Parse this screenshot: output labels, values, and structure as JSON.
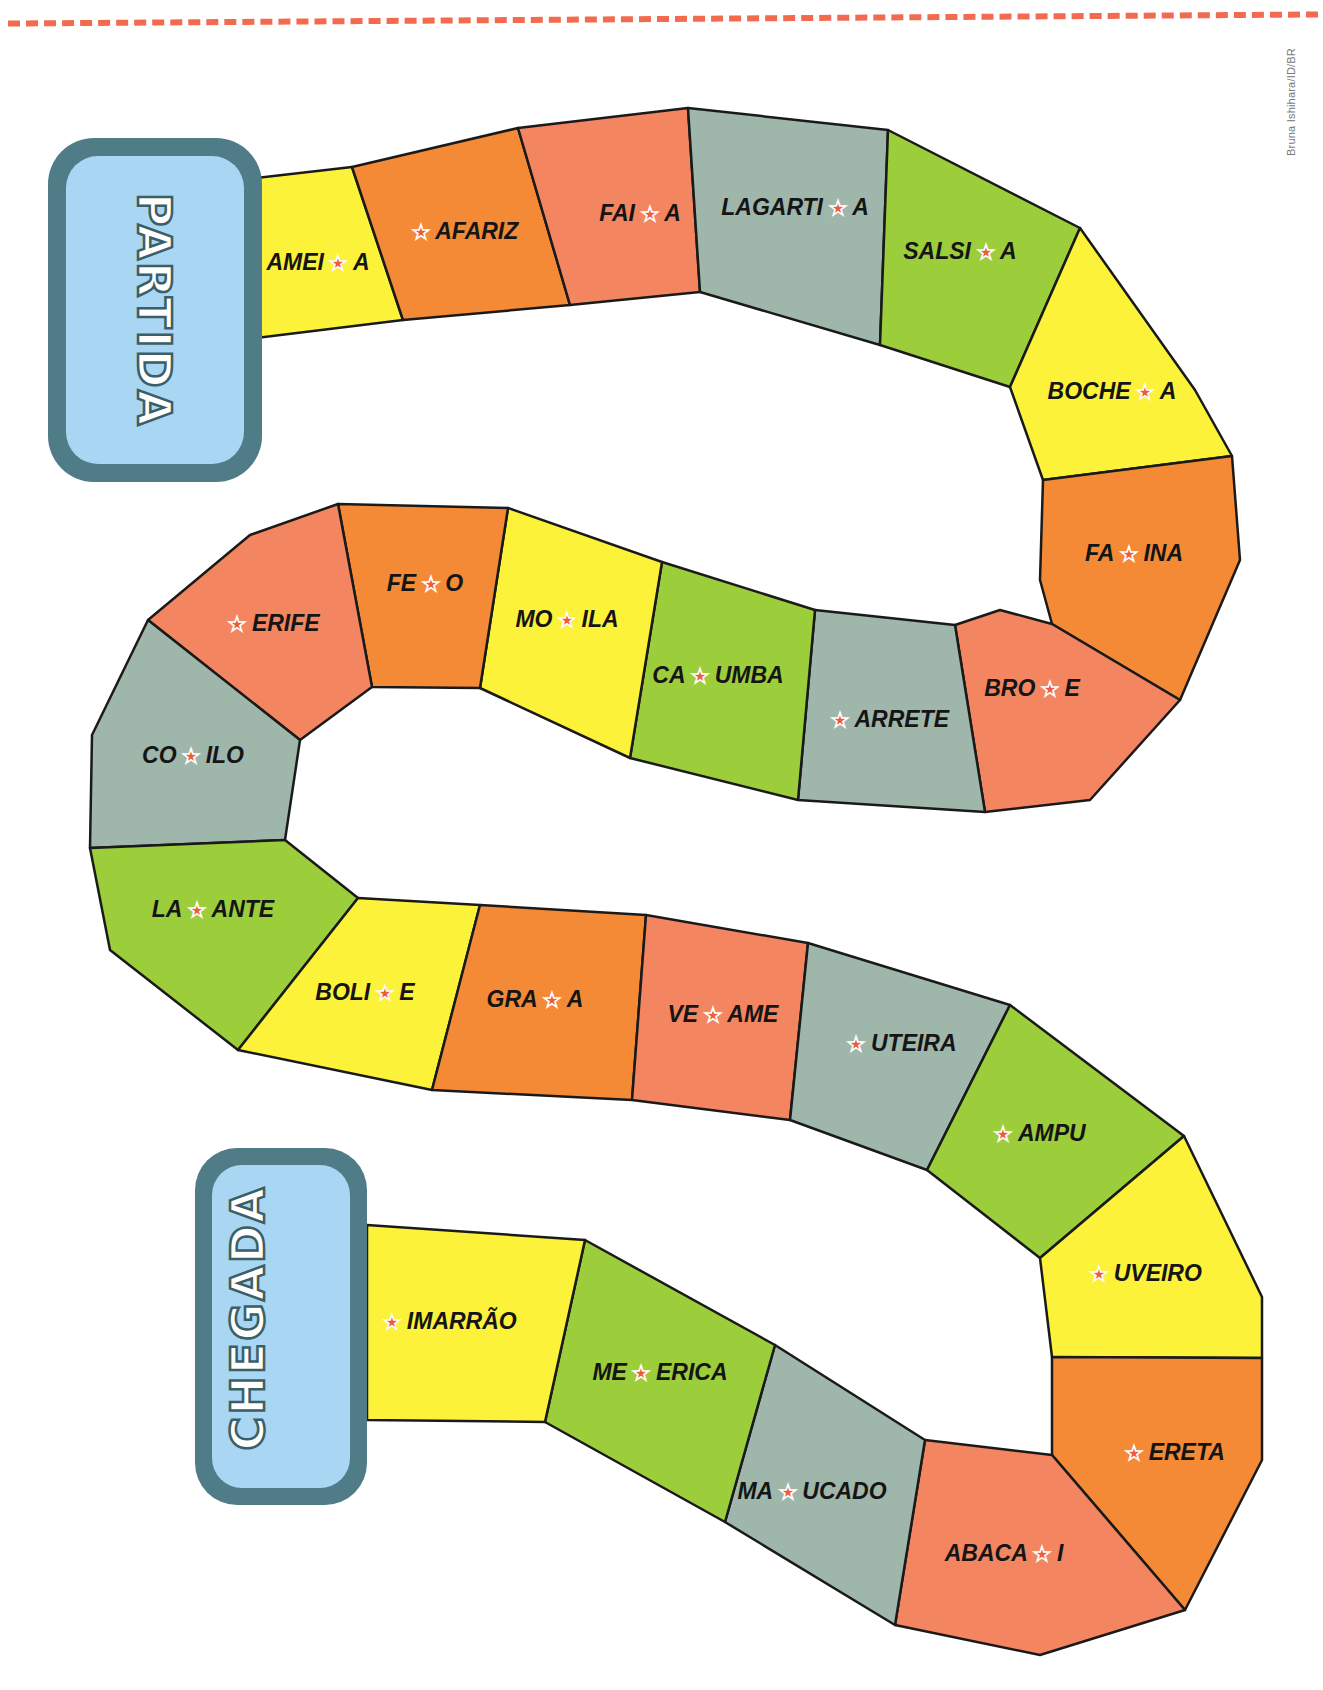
{
  "header": {
    "dashed_rule_color": "#f26a4f"
  },
  "credit": "Bruna Ishihara/ID/BR",
  "badges": {
    "start": "PARTIDA",
    "finish": "CHEGADA",
    "fill": "#a9d6f2",
    "border": "#4f7c86"
  },
  "colors": {
    "yellow": "#fdf23a",
    "orange": "#f48a35",
    "salmon": "#f38560",
    "gray": "#9fb6ab",
    "green": "#9ccd3a",
    "star": "#ef5a3c"
  },
  "squares": [
    {
      "pre": "AMEI",
      "post": "A",
      "color": "yellow"
    },
    {
      "pre": "",
      "post": "AFARIZ",
      "color": "orange"
    },
    {
      "pre": "FAI",
      "post": "A",
      "color": "salmon"
    },
    {
      "pre": "LAGARTI",
      "post": "A",
      "color": "gray"
    },
    {
      "pre": "SALSI",
      "post": "A",
      "color": "green"
    },
    {
      "pre": "BOCHE",
      "post": "A",
      "color": "yellow"
    },
    {
      "pre": "FA",
      "post": "INA",
      "color": "orange"
    },
    {
      "pre": "BRO",
      "post": "E",
      "color": "salmon"
    },
    {
      "pre": "",
      "post": "ARRETE",
      "color": "gray"
    },
    {
      "pre": "CA",
      "post": "UMBA",
      "color": "green"
    },
    {
      "pre": "MO",
      "post": "ILA",
      "color": "yellow"
    },
    {
      "pre": "FE",
      "post": "O",
      "color": "orange"
    },
    {
      "pre": "",
      "post": "ERIFE",
      "color": "salmon"
    },
    {
      "pre": "CO",
      "post": "ILO",
      "color": "gray"
    },
    {
      "pre": "LA",
      "post": "ANTE",
      "color": "green"
    },
    {
      "pre": "BOLI",
      "post": "E",
      "color": "yellow"
    },
    {
      "pre": "GRA",
      "post": "A",
      "color": "orange"
    },
    {
      "pre": "VE",
      "post": "AME",
      "color": "salmon"
    },
    {
      "pre": "",
      "post": "UTEIRA",
      "color": "gray"
    },
    {
      "pre": "",
      "post": "AMPU",
      "color": "green"
    },
    {
      "pre": "",
      "post": "UVEIRO",
      "color": "yellow"
    },
    {
      "pre": "",
      "post": "ERETA",
      "color": "orange"
    },
    {
      "pre": "ABACA",
      "post": "I",
      "color": "salmon"
    },
    {
      "pre": "MA",
      "post": "UCADO",
      "color": "gray"
    },
    {
      "pre": "ME",
      "post": "ERICA",
      "color": "green"
    },
    {
      "pre": "",
      "post": "IMARRÃO",
      "color": "yellow"
    }
  ]
}
